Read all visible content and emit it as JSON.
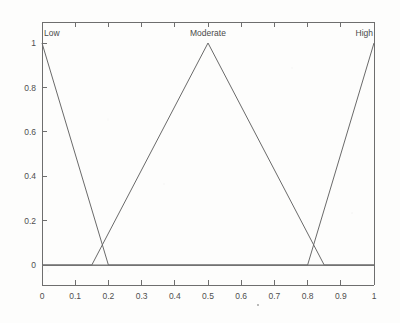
{
  "chart_data": {
    "type": "line",
    "title": "",
    "subtitle": "",
    "xlabel": "",
    "ylabel": "",
    "xlim": [
      0,
      1
    ],
    "ylim": [
      0,
      1
    ],
    "grid": false,
    "legend_position": "inline-above-peaks",
    "x_ticks": [
      "0",
      "0.1",
      "0.2",
      "0.3",
      "0.4",
      "0.5",
      "0.6",
      "0.7",
      "0.8",
      "0.9",
      "1"
    ],
    "x_tick_values": [
      0,
      0.1,
      0.2,
      0.3,
      0.4,
      0.5,
      0.6,
      0.7,
      0.8,
      0.9,
      1
    ],
    "y_ticks": [
      "0",
      "0.2",
      "0.4",
      "0.6",
      "0.8",
      "1"
    ],
    "y_tick_values": [
      0,
      0.2,
      0.4,
      0.6,
      0.8,
      1
    ],
    "series": [
      {
        "name": "Low",
        "label": "Low",
        "shape": "triangular",
        "points": [
          [
            0,
            1
          ],
          [
            0.2,
            0
          ],
          [
            1,
            0
          ]
        ],
        "x": [
          0,
          0.2,
          1
        ],
        "values": [
          1,
          0,
          0
        ],
        "color": "#6a6a6a"
      },
      {
        "name": "Moderate",
        "label": "Moderate",
        "shape": "triangular",
        "points": [
          [
            0,
            0
          ],
          [
            0.15,
            0
          ],
          [
            0.5,
            1
          ],
          [
            0.85,
            0
          ],
          [
            1,
            0
          ]
        ],
        "x": [
          0,
          0.15,
          0.5,
          0.85,
          1
        ],
        "values": [
          0,
          0,
          1,
          0,
          0
        ],
        "color": "#6a6a6a"
      },
      {
        "name": "High",
        "label": "High",
        "shape": "triangular",
        "points": [
          [
            0,
            0
          ],
          [
            0.8,
            0
          ],
          [
            1,
            1
          ]
        ],
        "x": [
          0,
          0.8,
          1
        ],
        "values": [
          0,
          0,
          1
        ],
        "color": "#6a6a6a"
      }
    ],
    "annotations": [
      {
        "text": "Low",
        "x": 0.0,
        "y": 1.0,
        "anchor": "left-above"
      },
      {
        "text": "Moderate",
        "x": 0.5,
        "y": 1.0,
        "anchor": "center-above"
      },
      {
        "text": "High",
        "x": 1.0,
        "y": 1.0,
        "anchor": "right-above"
      }
    ],
    "crossings": [
      {
        "between": [
          "Low",
          "Moderate"
        ],
        "x": 0.18,
        "y": 0.09
      },
      {
        "between": [
          "Moderate",
          "High"
        ],
        "x": 0.82,
        "y": 0.09
      }
    ]
  },
  "figure": {
    "background_color": "#fdfdfc",
    "axis_color": "#6e6e6e",
    "line_color": "#6a6a6a",
    "text_color": "#4a4a4a"
  }
}
